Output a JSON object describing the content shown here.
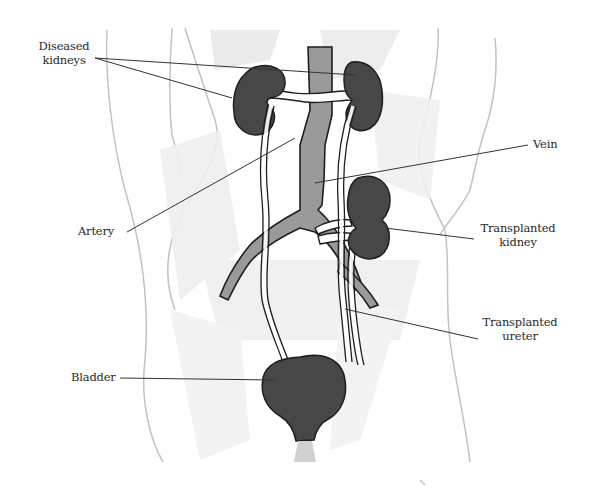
{
  "diagram": {
    "colors": {
      "background": "#ffffff",
      "organ_fill": "#474747",
      "vessel_fill": "#9a9a9a",
      "outline": "#1e1e1e",
      "body_sketch": "#c8c8c8",
      "leader_line": "#333333",
      "text": "#2a2a2a"
    },
    "labels": [
      {
        "id": "diseased-kidneys",
        "text": "Diseased\nkidneys"
      },
      {
        "id": "vein",
        "text": "Vein"
      },
      {
        "id": "artery",
        "text": "Artery"
      },
      {
        "id": "transplanted-kidney",
        "text": "Transplanted\nkidney"
      },
      {
        "id": "transplanted-ureter",
        "text": "Transplanted\nureter"
      },
      {
        "id": "bladder",
        "text": "Bladder"
      }
    ]
  }
}
